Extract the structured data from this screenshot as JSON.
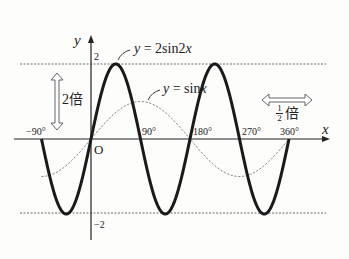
{
  "chart_data": {
    "type": "line",
    "title": "",
    "xlabel": "x",
    "ylabel": "y",
    "origin_label": "O",
    "xlim": [
      -100,
      380
    ],
    "ylim": [
      -2.4,
      2.4
    ],
    "x_ticks": [
      "-90°",
      "90°",
      "180°",
      "270°",
      "360°"
    ],
    "y_ticks": [
      "2",
      "-2"
    ],
    "grid": false,
    "guide_lines": [
      {
        "y": 2,
        "style": "dashed"
      },
      {
        "y": -2,
        "style": "dashed"
      }
    ],
    "series": [
      {
        "name": "y = 2sin2x",
        "style": "solid-thick",
        "x": [
          -90,
          -67.5,
          -45,
          -22.5,
          0,
          22.5,
          45,
          67.5,
          90,
          112.5,
          135,
          157.5,
          180,
          202.5,
          225,
          247.5,
          270,
          292.5,
          315,
          337.5,
          360
        ],
        "values": [
          0,
          1.414,
          2,
          1.414,
          0,
          1.414,
          2,
          1.414,
          0,
          -1.414,
          -2,
          -1.414,
          0,
          1.414,
          2,
          1.414,
          0,
          -1.414,
          -2,
          -1.414,
          0
        ]
      },
      {
        "name": "y = sinx",
        "style": "dashed-thin",
        "x": [
          -90,
          -45,
          0,
          45,
          90,
          135,
          180,
          225,
          270,
          315,
          360
        ],
        "values": [
          -1,
          -0.707,
          0,
          0.707,
          1,
          0.707,
          0,
          -0.707,
          -1,
          -0.707,
          0
        ]
      }
    ],
    "annotations": [
      {
        "text": "2倍",
        "meaning": "vertical stretch ×2",
        "arrow": "vertical double"
      },
      {
        "text": "1/2倍",
        "meaning": "horizontal compression ×1/2",
        "arrow": "horizontal double"
      },
      {
        "text": "y = 2sin2x",
        "target": "thick curve"
      },
      {
        "text": "y = sinx",
        "target": "dashed curve"
      }
    ]
  },
  "labels": {
    "y_axis": "y",
    "x_axis": "x",
    "origin": "O",
    "tick_2": "2",
    "tick_m2": "−2",
    "tick_m90": "−90°",
    "tick_90": "90°",
    "tick_180": "180°",
    "tick_270": "270°",
    "tick_360": "360°",
    "curve1_y": "y",
    "curve1_eq": " = 2sin2",
    "curve1_x": "x",
    "curve2_y": "y",
    "curve2_eq": " = sin",
    "curve2_x": "x",
    "stretch_num": "2",
    "stretch_kanji": "倍",
    "half_num": "1",
    "half_den": "2",
    "half_kanji": "倍"
  }
}
